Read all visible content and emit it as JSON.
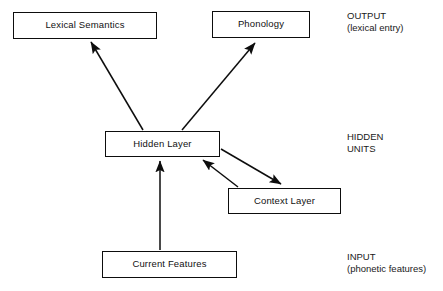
{
  "diagram": {
    "background_color": "#ffffff",
    "line_color": "#0d0d0d",
    "nodes": [
      {
        "id": "lexical-semantics",
        "label": "Lexical Semantics"
      },
      {
        "id": "phonology",
        "label": "Phonology"
      },
      {
        "id": "hidden-layer",
        "label": "Hidden Layer"
      },
      {
        "id": "context-layer",
        "label": "Context Layer"
      },
      {
        "id": "current-features",
        "label": "Current Features"
      }
    ],
    "annotations": [
      {
        "id": "output",
        "line1": "OUTPUT",
        "line2": "(lexical entry)"
      },
      {
        "id": "hidden",
        "line1": "HIDDEN",
        "line2": "UNITS"
      },
      {
        "id": "input",
        "line1": "INPUT",
        "line2": "(phonetic features)"
      }
    ],
    "edges": [
      {
        "id": "hidden-to-lexical",
        "from": "hidden-layer",
        "to": "lexical-semantics",
        "arrow": "single"
      },
      {
        "id": "hidden-to-phonology",
        "from": "hidden-layer",
        "to": "phonology",
        "arrow": "single"
      },
      {
        "id": "hidden-to-context",
        "from": "hidden-layer",
        "to": "context-layer",
        "arrow": "single"
      },
      {
        "id": "context-to-hidden",
        "from": "context-layer",
        "to": "hidden-layer",
        "arrow": "single"
      },
      {
        "id": "features-to-hidden",
        "from": "current-features",
        "to": "hidden-layer",
        "arrow": "single"
      }
    ]
  }
}
